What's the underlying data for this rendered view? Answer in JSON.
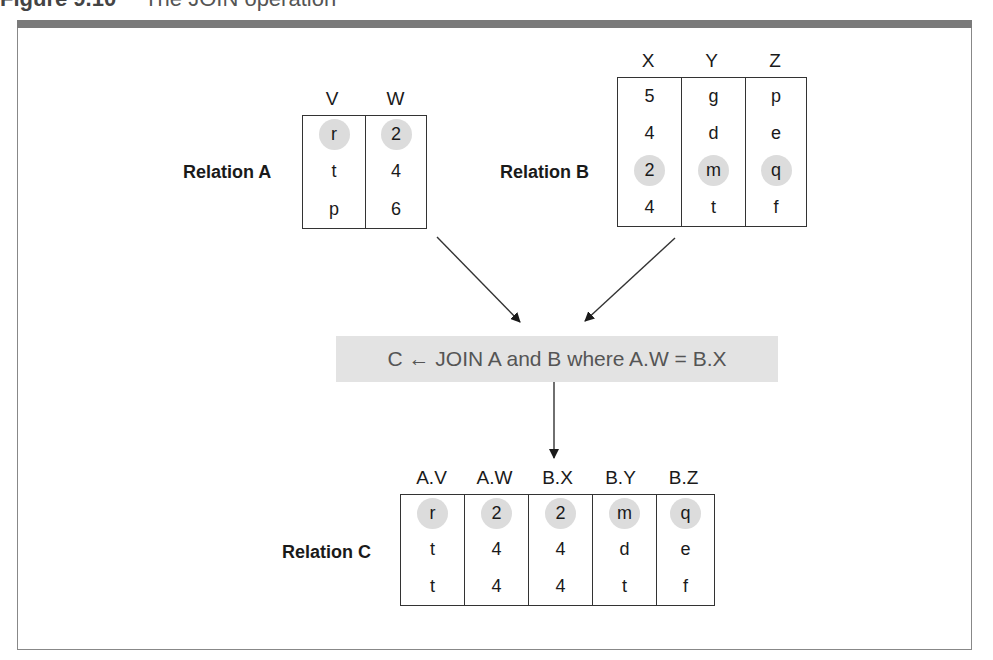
{
  "figure": {
    "number": "Figure 9.10",
    "caption": "The JOIN operation"
  },
  "relation_a": {
    "label": "Relation A",
    "columns": [
      "V",
      "W"
    ],
    "rows": [
      [
        "r",
        "2"
      ],
      [
        "t",
        "4"
      ],
      [
        "p",
        "6"
      ]
    ],
    "highlighted_row": 0
  },
  "relation_b": {
    "label": "Relation B",
    "columns": [
      "X",
      "Y",
      "Z"
    ],
    "rows": [
      [
        "5",
        "g",
        "p"
      ],
      [
        "4",
        "d",
        "e"
      ],
      [
        "2",
        "m",
        "q"
      ],
      [
        "4",
        "t",
        "f"
      ]
    ],
    "highlighted_row": 2
  },
  "operation": {
    "text": "C ← JOIN A and B where A.W = B.X"
  },
  "relation_c": {
    "label": "Relation C",
    "columns": [
      "A.V",
      "A.W",
      "B.X",
      "B.Y",
      "B.Z"
    ],
    "rows": [
      [
        "r",
        "2",
        "2",
        "m",
        "q"
      ],
      [
        "t",
        "4",
        "4",
        "d",
        "e"
      ],
      [
        "t",
        "4",
        "4",
        "t",
        "f"
      ]
    ],
    "highlighted_row": 0
  },
  "colors": {
    "highlight": "#dcdcdc",
    "operation_box": "#e3e3e3",
    "frame_bar": "#7a7a7a"
  }
}
